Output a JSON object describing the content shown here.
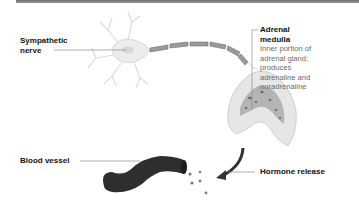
{
  "diagram": {
    "labels": {
      "sympathetic_nerve": [
        "Sympathetic",
        "nerve"
      ],
      "adrenal_medulla": {
        "title": [
          "Adrenal",
          "medulla"
        ],
        "description": [
          "Inner portion of",
          "adrenal gland;",
          "produces",
          "adrenaline and",
          "noradrenaline"
        ]
      },
      "blood_vessel": "Blood vessel",
      "hormone_release": "Hormone release"
    },
    "colors": {
      "top_bar": "#7a7a7a",
      "neuron_body": "#ececec",
      "axon": "#8a8a8a",
      "gland_outer": "#e3e3e3",
      "gland_medulla": "#a8a8a8",
      "vessel": "#2e2e2e",
      "arrow": "#3a3a3a",
      "leader_line": "#8c8c8c"
    }
  }
}
